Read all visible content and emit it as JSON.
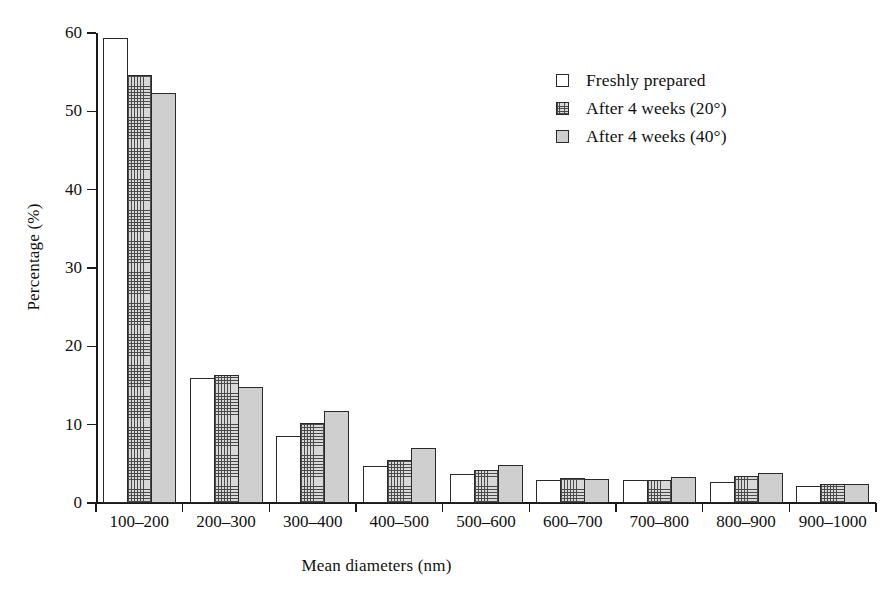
{
  "chart_data": {
    "type": "bar",
    "title": "",
    "xlabel": "Mean diameters (nm)",
    "ylabel": "Percentage (%)",
    "ylim": [
      0,
      60
    ],
    "yticks": [
      0,
      10,
      20,
      30,
      40,
      50,
      60
    ],
    "grid": false,
    "legend_position": "upper right",
    "categories": [
      "100–200",
      "200–300",
      "300–400",
      "400–500",
      "500–600",
      "600–700",
      "700–800",
      "800–900",
      "900–1000"
    ],
    "series": [
      {
        "name": "Freshly prepared",
        "fill": "white",
        "color": "#ffffff",
        "values": [
          59.4,
          16.0,
          8.5,
          4.7,
          3.7,
          3.0,
          2.9,
          2.7,
          2.2
        ]
      },
      {
        "name": "After 4 weeks (20°)",
        "fill": "cross-hatch",
        "color": "#d8d8d8",
        "values": [
          54.7,
          16.3,
          10.2,
          5.5,
          4.2,
          3.2,
          3.0,
          3.5,
          2.4
        ]
      },
      {
        "name": "After 4 weeks (40°)",
        "fill": "solid-gray",
        "color": "#cfcfcf",
        "values": [
          52.3,
          14.8,
          11.8,
          7.0,
          4.8,
          3.1,
          3.3,
          3.8,
          2.4
        ]
      }
    ]
  }
}
